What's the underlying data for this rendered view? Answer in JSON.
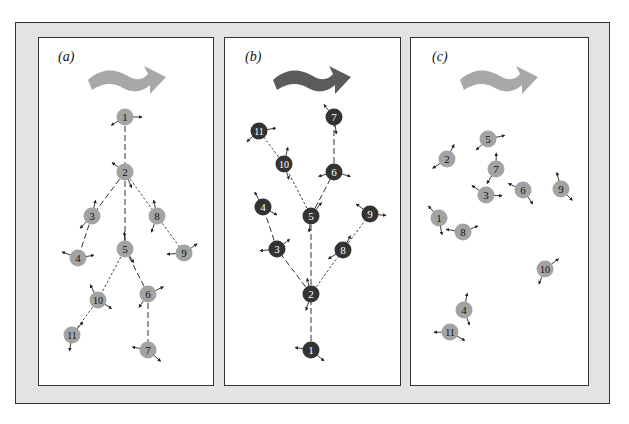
{
  "figure": {
    "colors": {
      "frame_bg": "#e3e3e3",
      "panel_bg": "#ffffff",
      "light_node": "#a3a3a3",
      "dark_node": "#333333",
      "light_arrow": "#a8a8a8",
      "dark_arrow": "#5c5c5c"
    },
    "panels": [
      {
        "id": "a",
        "label": "(a)",
        "style": "light",
        "nodes": [
          {
            "n": "1",
            "x": 125,
            "y": 117
          },
          {
            "n": "2",
            "x": 125,
            "y": 172
          },
          {
            "n": "3",
            "x": 92,
            "y": 216
          },
          {
            "n": "4",
            "x": 78,
            "y": 258
          },
          {
            "n": "5",
            "x": 125,
            "y": 249
          },
          {
            "n": "6",
            "x": 148,
            "y": 294
          },
          {
            "n": "7",
            "x": 148,
            "y": 350
          },
          {
            "n": "8",
            "x": 157,
            "y": 216
          },
          {
            "n": "9",
            "x": 184,
            "y": 253
          },
          {
            "n": "10",
            "x": 98,
            "y": 300
          },
          {
            "n": "11",
            "x": 72,
            "y": 335
          }
        ],
        "links": [
          {
            "from": "1",
            "to": "2",
            "dash": "long"
          },
          {
            "from": "2",
            "to": "3",
            "dash": "long"
          },
          {
            "from": "2",
            "to": "5",
            "dash": "long"
          },
          {
            "from": "2",
            "to": "8",
            "dash": "short"
          },
          {
            "from": "3",
            "to": "4",
            "dash": "long"
          },
          {
            "from": "5",
            "to": "6",
            "dash": "long"
          },
          {
            "from": "5",
            "to": "10",
            "dash": "short"
          },
          {
            "from": "6",
            "to": "7",
            "dash": "long"
          },
          {
            "from": "8",
            "to": "9",
            "dash": "short"
          },
          {
            "from": "10",
            "to": "11",
            "dash": "short"
          }
        ]
      },
      {
        "id": "b",
        "label": "(b)",
        "style": "dark",
        "nodes": [
          {
            "n": "1",
            "x": 311,
            "y": 350
          },
          {
            "n": "2",
            "x": 311,
            "y": 294
          },
          {
            "n": "3",
            "x": 277,
            "y": 249
          },
          {
            "n": "4",
            "x": 263,
            "y": 207
          },
          {
            "n": "5",
            "x": 311,
            "y": 216
          },
          {
            "n": "6",
            "x": 334,
            "y": 172
          },
          {
            "n": "7",
            "x": 334,
            "y": 117
          },
          {
            "n": "8",
            "x": 343,
            "y": 250
          },
          {
            "n": "9",
            "x": 370,
            "y": 214
          },
          {
            "n": "10",
            "x": 284,
            "y": 164
          },
          {
            "n": "11",
            "x": 259,
            "y": 131
          }
        ],
        "links": [
          {
            "from": "1",
            "to": "2",
            "dash": "long"
          },
          {
            "from": "2",
            "to": "3",
            "dash": "long"
          },
          {
            "from": "2",
            "to": "5",
            "dash": "long"
          },
          {
            "from": "2",
            "to": "8",
            "dash": "short"
          },
          {
            "from": "3",
            "to": "4",
            "dash": "long"
          },
          {
            "from": "5",
            "to": "6",
            "dash": "long"
          },
          {
            "from": "5",
            "to": "10",
            "dash": "short"
          },
          {
            "from": "6",
            "to": "7",
            "dash": "long"
          },
          {
            "from": "8",
            "to": "9",
            "dash": "short"
          },
          {
            "from": "10",
            "to": "11",
            "dash": "short"
          }
        ]
      },
      {
        "id": "c",
        "label": "(c)",
        "style": "light",
        "nodes": [
          {
            "n": "1",
            "x": 439,
            "y": 218
          },
          {
            "n": "2",
            "x": 447,
            "y": 159
          },
          {
            "n": "3",
            "x": 486,
            "y": 195
          },
          {
            "n": "4",
            "x": 464,
            "y": 310
          },
          {
            "n": "5",
            "x": 488,
            "y": 139
          },
          {
            "n": "6",
            "x": 523,
            "y": 190
          },
          {
            "n": "7",
            "x": 496,
            "y": 169
          },
          {
            "n": "8",
            "x": 463,
            "y": 232
          },
          {
            "n": "9",
            "x": 561,
            "y": 189
          },
          {
            "n": "10",
            "x": 545,
            "y": 269
          },
          {
            "n": "11",
            "x": 450,
            "y": 332
          }
        ],
        "links": []
      }
    ]
  }
}
